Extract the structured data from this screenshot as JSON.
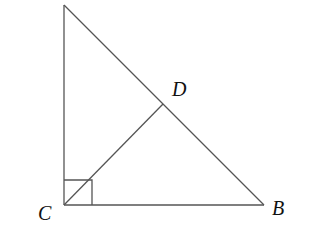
{
  "diagram": {
    "type": "geometry",
    "points": {
      "A": {
        "x": 64,
        "y": 5,
        "label": ""
      },
      "C": {
        "x": 64,
        "y": 205,
        "label": "C"
      },
      "B": {
        "x": 264,
        "y": 205,
        "label": "B"
      },
      "D": {
        "x": 163,
        "y": 104,
        "label": "D"
      }
    },
    "segments": [
      {
        "from": "A",
        "to": "C"
      },
      {
        "from": "C",
        "to": "B"
      },
      {
        "from": "A",
        "to": "B"
      },
      {
        "from": "C",
        "to": "D"
      }
    ],
    "right_angle_marker": {
      "at": "C",
      "size": 28
    },
    "labels": {
      "C": "C",
      "B": "B",
      "D": "D"
    },
    "colors": {
      "stroke": "#555555",
      "text": "#111111",
      "background": "#ffffff"
    }
  }
}
